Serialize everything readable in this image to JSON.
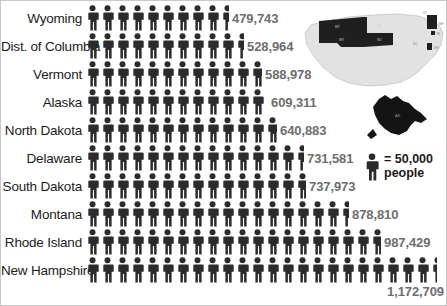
{
  "legend": {
    "icon": "person-icon",
    "text": "= 50,000\npeople",
    "unit_value": 50000
  },
  "map": {
    "us_map_name": "us-states-map",
    "alaska_map_name": "alaska-inset-map",
    "highlighted_labels": [
      "MT",
      "ND",
      "SD",
      "WY",
      "VT",
      "NH",
      "RI",
      "DC",
      "DE",
      "AK"
    ],
    "fill_highlight": "#1f1f1f",
    "fill_base": "#e2e2e2"
  },
  "colors": {
    "figure": "#2b2b2b",
    "label": "#1b1b1b",
    "value": "#6e6e6e",
    "border": "#c9c9c9"
  },
  "chart_data": {
    "type": "bar",
    "title": "",
    "xlabel": "",
    "ylabel": "",
    "unit": 50000,
    "unit_label": "= 50,000 people",
    "categories": [
      "Wyoming",
      "Dist. of Columbia",
      "Vermont",
      "Alaska",
      "North Dakota",
      "Delaware",
      "South Dakota",
      "Montana",
      "Rhode Island",
      "New Hampshire"
    ],
    "values": [
      479743,
      528964,
      588978,
      609311,
      640883,
      731581,
      737973,
      878810,
      987429,
      1172709
    ],
    "value_labels": [
      "479,743",
      "528,964",
      "588,978",
      "609,311",
      "640,883",
      "731,581",
      "737,973",
      "878,810",
      "987,429",
      "1,172,709"
    ],
    "icons": [
      9.59,
      10.58,
      11.78,
      12.19,
      12.82,
      14.63,
      14.76,
      17.58,
      19.75,
      23.45
    ],
    "grid": false,
    "legend_position": "right"
  }
}
